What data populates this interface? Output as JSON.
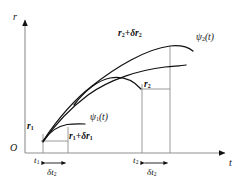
{
  "figure": {
    "background_color": "#ffffff",
    "stroke_color": "#111111",
    "thin_stroke_color": "#8a8a8a"
  },
  "axes": {
    "y_axis_label": "r",
    "x_axis_label": "t",
    "origin_label": "O",
    "x_axis_y": 153,
    "y_axis_x": 25,
    "x_axis_start": 25,
    "x_axis_end": 228,
    "y_axis_top": 17,
    "grid": false
  },
  "ticks": [
    {
      "name": "t1",
      "label_html": "t",
      "subscript": "1",
      "x": 43
    },
    {
      "name": "t2",
      "label_html": "t",
      "subscript": "2",
      "x": 142
    }
  ],
  "intervals": [
    {
      "name": "delta-t2-left",
      "label_html": "&delta;t",
      "subscript": "2",
      "x_start": 43,
      "x_end": 68
    },
    {
      "name": "delta-t2-right",
      "label_html": "&delta;t",
      "subscript": "2",
      "x_start": 142,
      "x_end": 170
    }
  ],
  "point_labels": [
    {
      "name": "r1",
      "text_html": "r",
      "subscript": "1",
      "x": 28,
      "y": 124
    },
    {
      "name": "r1-plus-delta-r1",
      "text_html": "r",
      "subscript": "1",
      "suffix_html": "+&delta;r",
      "suffix_sub": "1",
      "x": 70,
      "y": 134
    },
    {
      "name": "r2",
      "text_html": "r",
      "subscript": "2",
      "x": 144,
      "y": 83
    },
    {
      "name": "r2-plus-delta-r2",
      "text_html": "r",
      "subscript": "2",
      "suffix_html": "+&delta;r",
      "suffix_sub": "2",
      "x": 119,
      "y": 31
    }
  ],
  "curve_labels": [
    {
      "name": "psi1",
      "text_html": "&psi;",
      "subscript": "1",
      "arg": "(t)",
      "x": 91,
      "y": 116
    },
    {
      "name": "psi2",
      "text_html": "&psi;",
      "subscript": "2",
      "arg": "(t)",
      "x": 196,
      "y": 36
    }
  ],
  "chart_data": {
    "type": "line",
    "title": "",
    "xlabel": "t",
    "ylabel": "r",
    "grid": false,
    "legend": "inline-annotations",
    "series": [
      {
        "name": "psi2(t)",
        "description": "Upper long varied path from (t1, r1) rising to (t2+delta t2, r2+delta r2)",
        "path_px": [
          [
            43,
            141
          ],
          [
            52,
            128
          ],
          [
            62,
            114
          ],
          [
            74,
            101
          ],
          [
            88,
            88
          ],
          [
            104,
            76
          ],
          [
            122,
            64
          ],
          [
            140,
            55
          ],
          [
            156,
            49
          ],
          [
            170,
            47
          ],
          [
            182,
            47
          ],
          [
            192,
            50
          ]
        ]
      },
      {
        "name": "psi-actual",
        "description": "Lower curve crossing from origin point, peaking near t=110 and descending to r2",
        "path_px": [
          [
            43,
            142
          ],
          [
            49,
            134
          ],
          [
            56,
            124
          ],
          [
            64,
            113
          ],
          [
            74,
            103
          ],
          [
            86,
            93
          ],
          [
            99,
            84
          ],
          [
            113,
            78
          ],
          [
            128,
            74
          ],
          [
            143,
            72
          ],
          [
            157,
            70
          ],
          [
            170,
            68
          ],
          [
            182,
            66
          ]
        ]
      },
      {
        "name": "psi1(t)",
        "description": "Short lower-left path flattening after t1",
        "path_px": [
          [
            43,
            141
          ],
          [
            50,
            133
          ],
          [
            58,
            128
          ],
          [
            66,
            125
          ],
          [
            74,
            124
          ],
          [
            84,
            124
          ]
        ]
      },
      {
        "name": "mid-arc",
        "description": "Intermediate arc peaking near t=110 then falling to the r2 marker",
        "path_px": [
          [
            75,
            104
          ],
          [
            86,
            92
          ],
          [
            98,
            83
          ],
          [
            110,
            78
          ],
          [
            122,
            78
          ],
          [
            132,
            82
          ],
          [
            140,
            88
          ]
        ]
      }
    ],
    "leader_lines": [
      {
        "name": "r1-horizontal",
        "x1": 43,
        "y1": 141,
        "x2": 68,
        "y2": 141
      },
      {
        "name": "r2-horizontal",
        "x1": 142,
        "y1": 89,
        "x2": 170,
        "y2": 89
      }
    ],
    "drop_lines": [
      {
        "name": "drop-t1",
        "x": 43,
        "y_top": 133,
        "y_bottom": 153
      },
      {
        "name": "drop-t1-plus",
        "x": 68,
        "y_top": 128,
        "y_bottom": 153
      },
      {
        "name": "drop-t2",
        "x": 142,
        "y_top": 85,
        "y_bottom": 153
      },
      {
        "name": "drop-t2-plus",
        "x": 170,
        "y_top": 46,
        "y_bottom": 153
      }
    ]
  }
}
